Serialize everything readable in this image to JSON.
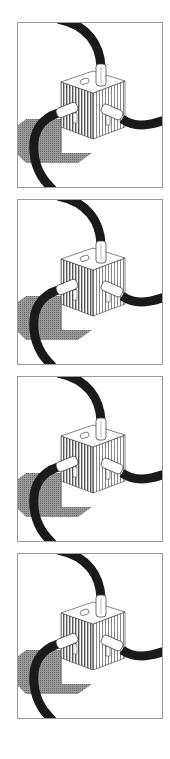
{
  "figure": {
    "panels": [
      {
        "id": 1,
        "top": 22,
        "label": "Panel 1"
      },
      {
        "id": 2,
        "top": 199,
        "label": "Panel 2"
      },
      {
        "id": 3,
        "top": 376,
        "label": "Panel 3"
      },
      {
        "id": 4,
        "top": 553,
        "label": "Panel 4"
      }
    ],
    "colors": {
      "cable": "#1a1a1a",
      "shadow": "#8a8a8a",
      "cube_top": "#ffffff",
      "hatch": "#555555",
      "border": "#9a9a9a"
    }
  }
}
